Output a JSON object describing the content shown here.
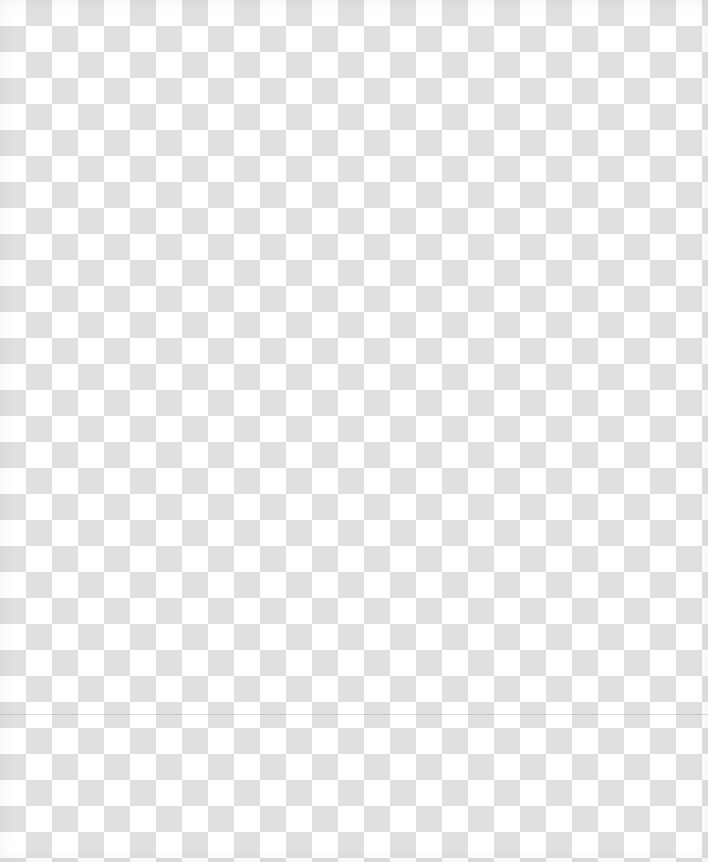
{
  "canvas": {
    "pattern": "transparency-checkerboard",
    "cell_size_px": 26,
    "colors": {
      "light": "#ffffff",
      "dark": "#e0e0e0"
    }
  }
}
